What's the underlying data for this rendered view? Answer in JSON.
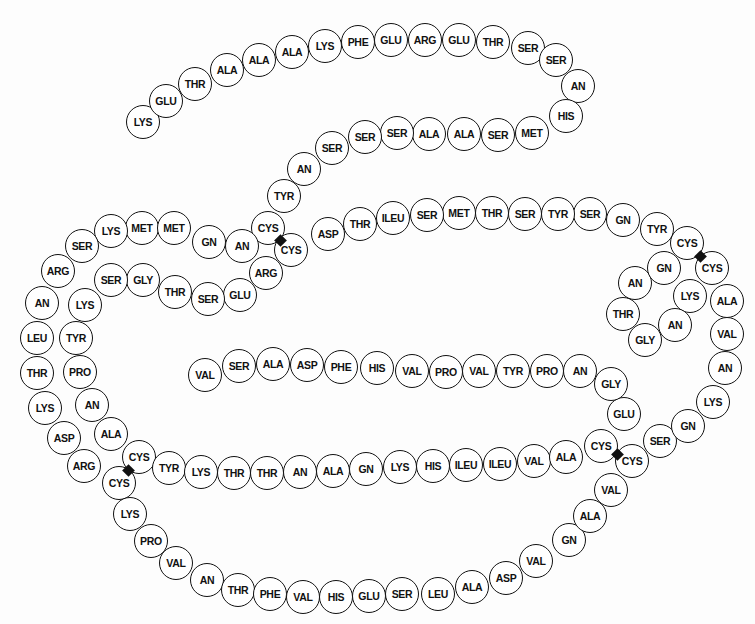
{
  "diagram": {
    "type": "protein-primary-structure",
    "residue_count": 124,
    "disulfide_bridge_count": 4,
    "residues": [
      {
        "label": "LYS",
        "x": 143,
        "y": 122
      },
      {
        "label": "GLU",
        "x": 166,
        "y": 101
      },
      {
        "label": "THR",
        "x": 195,
        "y": 84
      },
      {
        "label": "ALA",
        "x": 227,
        "y": 70
      },
      {
        "label": "ALA",
        "x": 259,
        "y": 60
      },
      {
        "label": "ALA",
        "x": 292,
        "y": 52
      },
      {
        "label": "LYS",
        "x": 325,
        "y": 46
      },
      {
        "label": "PHE",
        "x": 358,
        "y": 42
      },
      {
        "label": "GLU",
        "x": 391,
        "y": 40
      },
      {
        "label": "ARG",
        "x": 425,
        "y": 40
      },
      {
        "label": "GLU",
        "x": 459,
        "y": 40
      },
      {
        "label": "THR",
        "x": 493,
        "y": 42
      },
      {
        "label": "SER",
        "x": 528,
        "y": 48
      },
      {
        "label": "SER",
        "x": 556,
        "y": 60
      },
      {
        "label": "AN",
        "x": 578,
        "y": 86
      },
      {
        "label": "HIS",
        "x": 566,
        "y": 116
      },
      {
        "label": "MET",
        "x": 532,
        "y": 133
      },
      {
        "label": "SER",
        "x": 498,
        "y": 135
      },
      {
        "label": "ALA",
        "x": 464,
        "y": 134
      },
      {
        "label": "ALA",
        "x": 429,
        "y": 134
      },
      {
        "label": "SER",
        "x": 397,
        "y": 133
      },
      {
        "label": "SER",
        "x": 365,
        "y": 137
      },
      {
        "label": "SER",
        "x": 332,
        "y": 148
      },
      {
        "label": "AN",
        "x": 304,
        "y": 169
      },
      {
        "label": "TYR",
        "x": 284,
        "y": 196
      },
      {
        "label": "CYS",
        "x": 268,
        "y": 228
      },
      {
        "label": "MET",
        "x": 142,
        "y": 228
      },
      {
        "label": "LYS",
        "x": 111,
        "y": 231
      },
      {
        "label": "SER",
        "x": 82,
        "y": 246
      },
      {
        "label": "ARG",
        "x": 58,
        "y": 271
      },
      {
        "label": "AN",
        "x": 42,
        "y": 303
      },
      {
        "label": "LEU",
        "x": 37,
        "y": 338
      },
      {
        "label": "THR",
        "x": 37,
        "y": 373
      },
      {
        "label": "LYS",
        "x": 45,
        "y": 408
      },
      {
        "label": "ASP",
        "x": 64,
        "y": 438
      },
      {
        "label": "ARG",
        "x": 84,
        "y": 466
      },
      {
        "label": "CYS",
        "x": 119,
        "y": 483
      },
      {
        "label": "LYS",
        "x": 130,
        "y": 514
      },
      {
        "label": "PRO",
        "x": 151,
        "y": 541
      },
      {
        "label": "VAL",
        "x": 176,
        "y": 563
      },
      {
        "label": "AN",
        "x": 207,
        "y": 580
      },
      {
        "label": "THR",
        "x": 238,
        "y": 590
      },
      {
        "label": "PHE",
        "x": 270,
        "y": 594
      },
      {
        "label": "VAL",
        "x": 303,
        "y": 597
      },
      {
        "label": "HIS",
        "x": 336,
        "y": 597
      },
      {
        "label": "GLU",
        "x": 369,
        "y": 596
      },
      {
        "label": "SER",
        "x": 402,
        "y": 594
      },
      {
        "label": "LEU",
        "x": 438,
        "y": 594
      },
      {
        "label": "ALA",
        "x": 472,
        "y": 587
      },
      {
        "label": "ASP",
        "x": 506,
        "y": 578
      },
      {
        "label": "VAL",
        "x": 536,
        "y": 561
      },
      {
        "label": "GN",
        "x": 569,
        "y": 540
      },
      {
        "label": "ALA",
        "x": 590,
        "y": 516
      },
      {
        "label": "VAL",
        "x": 611,
        "y": 490
      },
      {
        "label": "CYS",
        "x": 632,
        "y": 461
      },
      {
        "label": "SER",
        "x": 660,
        "y": 441
      },
      {
        "label": "GN",
        "x": 688,
        "y": 426
      },
      {
        "label": "LYS",
        "x": 713,
        "y": 402
      },
      {
        "label": "AN",
        "x": 725,
        "y": 368
      },
      {
        "label": "VAL",
        "x": 727,
        "y": 334
      },
      {
        "label": "ALA",
        "x": 727,
        "y": 301
      },
      {
        "label": "CYS",
        "x": 712,
        "y": 268
      },
      {
        "label": "LYS",
        "x": 690,
        "y": 296
      },
      {
        "label": "AN",
        "x": 675,
        "y": 325
      },
      {
        "label": "GLY",
        "x": 645,
        "y": 340
      },
      {
        "label": "THR",
        "x": 623,
        "y": 314
      },
      {
        "label": "AN",
        "x": 635,
        "y": 283
      },
      {
        "label": "GN",
        "x": 664,
        "y": 268
      },
      {
        "label": "CYS",
        "x": 687,
        "y": 243
      },
      {
        "label": "TYR",
        "x": 657,
        "y": 229
      },
      {
        "label": "GN",
        "x": 623,
        "y": 220
      },
      {
        "label": "SER",
        "x": 590,
        "y": 214
      },
      {
        "label": "TYR",
        "x": 558,
        "y": 214
      },
      {
        "label": "SER",
        "x": 525,
        "y": 214
      },
      {
        "label": "THR",
        "x": 492,
        "y": 213
      },
      {
        "label": "MET",
        "x": 459,
        "y": 213
      },
      {
        "label": "SER",
        "x": 427,
        "y": 215
      },
      {
        "label": "ILEU",
        "x": 393,
        "y": 218
      },
      {
        "label": "THR",
        "x": 360,
        "y": 224
      },
      {
        "label": "ASP",
        "x": 328,
        "y": 234
      },
      {
        "label": "CYS",
        "x": 291,
        "y": 250
      },
      {
        "label": "ARG",
        "x": 266,
        "y": 273
      },
      {
        "label": "GLU",
        "x": 240,
        "y": 295
      },
      {
        "label": "SER",
        "x": 208,
        "y": 299
      },
      {
        "label": "THR",
        "x": 175,
        "y": 292
      },
      {
        "label": "GLY",
        "x": 143,
        "y": 280
      },
      {
        "label": "SER",
        "x": 111,
        "y": 280
      },
      {
        "label": "LYS",
        "x": 85,
        "y": 305
      },
      {
        "label": "TYR",
        "x": 76,
        "y": 338
      },
      {
        "label": "PRO",
        "x": 80,
        "y": 372
      },
      {
        "label": "AN",
        "x": 92,
        "y": 405
      },
      {
        "label": "ALA",
        "x": 111,
        "y": 434
      },
      {
        "label": "CYS",
        "x": 139,
        "y": 457
      },
      {
        "label": "TYR",
        "x": 169,
        "y": 468
      },
      {
        "label": "LYS",
        "x": 201,
        "y": 472
      },
      {
        "label": "THR",
        "x": 234,
        "y": 473
      },
      {
        "label": "THR",
        "x": 267,
        "y": 473
      },
      {
        "label": "AN",
        "x": 300,
        "y": 472
      },
      {
        "label": "ALA",
        "x": 333,
        "y": 471
      },
      {
        "label": "GN",
        "x": 366,
        "y": 469
      },
      {
        "label": "LYS",
        "x": 400,
        "y": 467
      },
      {
        "label": "HIS",
        "x": 433,
        "y": 466
      },
      {
        "label": "ILEU",
        "x": 466,
        "y": 465
      },
      {
        "label": "ILEU",
        "x": 500,
        "y": 464
      },
      {
        "label": "VAL",
        "x": 534,
        "y": 461
      },
      {
        "label": "ALA",
        "x": 566,
        "y": 457
      },
      {
        "label": "CYS",
        "x": 601,
        "y": 446
      },
      {
        "label": "GLU",
        "x": 624,
        "y": 414
      },
      {
        "label": "GLY",
        "x": 611,
        "y": 384
      },
      {
        "label": "AN",
        "x": 580,
        "y": 371
      },
      {
        "label": "PRO",
        "x": 547,
        "y": 371
      },
      {
        "label": "TYR",
        "x": 513,
        "y": 371
      },
      {
        "label": "VAL",
        "x": 479,
        "y": 371
      },
      {
        "label": "PRO",
        "x": 446,
        "y": 372
      },
      {
        "label": "VAL",
        "x": 412,
        "y": 371
      },
      {
        "label": "HIS",
        "x": 377,
        "y": 368
      },
      {
        "label": "PHE",
        "x": 341,
        "y": 367
      },
      {
        "label": "ASP",
        "x": 307,
        "y": 365
      },
      {
        "label": "ALA",
        "x": 273,
        "y": 364
      },
      {
        "label": "SER",
        "x": 239,
        "y": 366
      },
      {
        "label": "VAL",
        "x": 205,
        "y": 375
      }
    ],
    "extra_residues": [
      {
        "label": "MET",
        "x": 174,
        "y": 228
      },
      {
        "label": "GN",
        "x": 209,
        "y": 242
      },
      {
        "label": "AN",
        "x": 242,
        "y": 246
      }
    ],
    "disulfide_bridges": [
      {
        "x": 280,
        "y": 240
      },
      {
        "x": 700,
        "y": 256
      },
      {
        "x": 128,
        "y": 470
      },
      {
        "x": 617,
        "y": 454
      }
    ]
  }
}
